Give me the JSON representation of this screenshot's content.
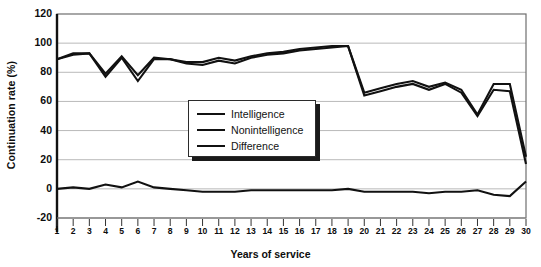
{
  "chart_data": {
    "type": "line",
    "title": "",
    "xlabel": "Years of service",
    "ylabel": "Continuation rate (%)",
    "xlim": [
      1,
      30
    ],
    "ylim": [
      -20,
      120
    ],
    "yticks": [
      -20,
      0,
      20,
      40,
      60,
      80,
      100,
      120
    ],
    "grid": true,
    "legend_position": "center-left-inside",
    "x": [
      1,
      2,
      3,
      4,
      5,
      6,
      7,
      8,
      9,
      10,
      11,
      12,
      13,
      14,
      15,
      16,
      17,
      18,
      19,
      20,
      21,
      22,
      23,
      24,
      25,
      26,
      27,
      28,
      29,
      30
    ],
    "categories": [
      "1",
      "2",
      "3",
      "4",
      "5",
      "6",
      "7",
      "8",
      "9",
      "10",
      "11",
      "12",
      "13",
      "14",
      "15",
      "16",
      "17",
      "18",
      "19",
      "20",
      "21",
      "22",
      "23",
      "24",
      "25",
      "26",
      "27",
      "28",
      "29",
      "30"
    ],
    "series": [
      {
        "name": "Intelligence",
        "color": "#111111",
        "values": [
          89,
          92,
          93,
          77,
          90,
          74,
          89,
          89,
          86,
          85,
          88,
          86,
          90,
          92,
          93,
          95,
          96,
          97,
          98,
          64,
          67,
          70,
          72,
          68,
          72,
          66,
          50,
          68,
          67,
          17
        ]
      },
      {
        "name": "Nonintelligence",
        "color": "#111111",
        "values": [
          89,
          93,
          93,
          79,
          91,
          78,
          90,
          89,
          87,
          87,
          90,
          88,
          91,
          93,
          94,
          96,
          97,
          98,
          98,
          66,
          69,
          72,
          74,
          70,
          73,
          68,
          51,
          72,
          72,
          22
        ]
      },
      {
        "name": "Difference",
        "color": "#111111",
        "values": [
          0,
          1,
          0,
          3,
          1,
          5,
          1,
          0,
          -1,
          -2,
          -2,
          -2,
          -1,
          -1,
          -1,
          -1,
          -1,
          -1,
          0,
          -2,
          -2,
          -2,
          -2,
          -3,
          -2,
          -2,
          -1,
          -4,
          -5,
          5
        ]
      }
    ]
  },
  "axes": {
    "y_title": "Continuation rate (%)",
    "x_title": "Years of service",
    "y_tick_labels": [
      "120",
      "100",
      "80",
      "60",
      "40",
      "20",
      "0",
      "-20"
    ],
    "x_tick_labels": [
      "1",
      "2",
      "3",
      "4",
      "5",
      "6",
      "7",
      "8",
      "9",
      "10",
      "11",
      "12",
      "13",
      "14",
      "15",
      "16",
      "17",
      "18",
      "19",
      "20",
      "21",
      "22",
      "23",
      "24",
      "25",
      "26",
      "27",
      "28",
      "29",
      "30"
    ]
  },
  "legend": {
    "items": [
      {
        "label": "Intelligence"
      },
      {
        "label": "Nonintelligence"
      },
      {
        "label": "Difference"
      }
    ]
  },
  "colors": {
    "line": "#111111",
    "grid": "#b9b9b9",
    "frame": "#6e6e6e",
    "text": "#0d0d0d",
    "background": "#ffffff"
  }
}
